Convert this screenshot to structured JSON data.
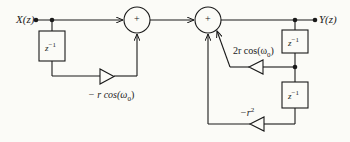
{
  "diagram": {
    "type": "signal-flow block diagram",
    "colors": {
      "stroke": "#1a1a1a",
      "background": "#fbfbf7"
    },
    "input_label": "X(z)",
    "output_label": "Y(z)",
    "adders": [
      {
        "id": "adder-1",
        "symbol": "+"
      },
      {
        "id": "adder-2",
        "symbol": "+"
      }
    ],
    "delays": [
      {
        "id": "delay-feedforward",
        "label": "z",
        "exp": "−1"
      },
      {
        "id": "delay-feedback-1",
        "label": "z",
        "exp": "−1"
      },
      {
        "id": "delay-feedback-2",
        "label": "z",
        "exp": "−1"
      }
    ],
    "gains": {
      "feedforward": {
        "prefix": "− r cos(ω",
        "sub": "0",
        "suffix": ")"
      },
      "feedback_1": {
        "prefix": "2r cos(ω",
        "sub": "0",
        "suffix": ")"
      },
      "feedback_2": {
        "prefix": "−r",
        "sup": "2"
      }
    }
  }
}
